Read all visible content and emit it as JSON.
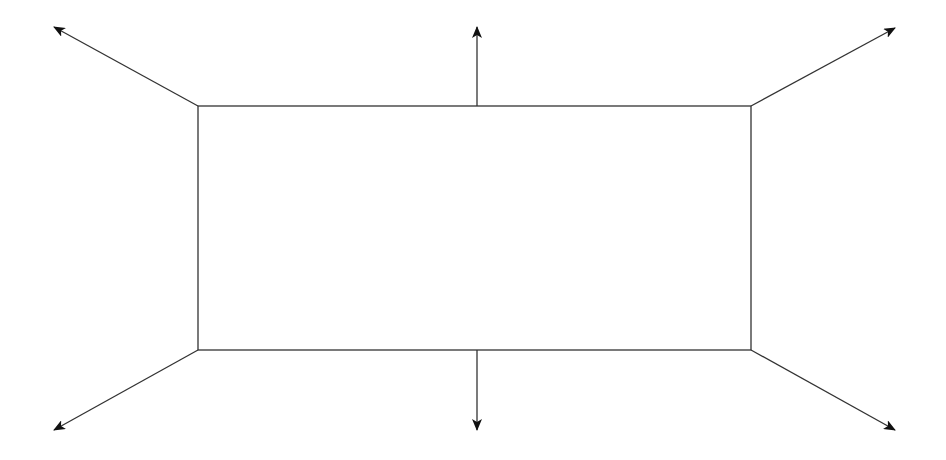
{
  "diagram": {
    "type": "rectangle-with-outward-arrows",
    "background": "#ffffff",
    "stroke_color": "#333333",
    "arrowhead_color": "#111111",
    "rectangle": {
      "x": 198,
      "y": 106,
      "width": 553,
      "height": 244
    },
    "arrows": [
      {
        "name": "arrow-top-left",
        "from": [
          198,
          106
        ],
        "to": [
          54,
          27
        ]
      },
      {
        "name": "arrow-top",
        "from": [
          477,
          106
        ],
        "to": [
          477,
          27
        ]
      },
      {
        "name": "arrow-top-right",
        "from": [
          751,
          106
        ],
        "to": [
          895,
          28
        ]
      },
      {
        "name": "arrow-bottom-left",
        "from": [
          198,
          350
        ],
        "to": [
          54,
          430
        ]
      },
      {
        "name": "arrow-bottom",
        "from": [
          477,
          350
        ],
        "to": [
          477,
          430
        ]
      },
      {
        "name": "arrow-bottom-right",
        "from": [
          751,
          350
        ],
        "to": [
          895,
          430
        ]
      }
    ]
  }
}
